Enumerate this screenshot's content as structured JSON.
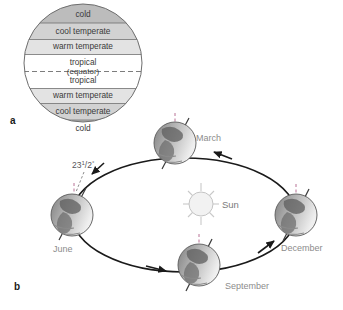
{
  "figure": {
    "background": "#ffffff",
    "panels": [
      {
        "id": "a",
        "letter": "a",
        "caption": ""
      },
      {
        "id": "b",
        "letter": "b",
        "caption": ""
      }
    ]
  },
  "climate_diagram": {
    "panel": "a",
    "equator_label": "(equator)",
    "bands": [
      {
        "label": "cold",
        "hemisphere": "north",
        "fill": "#bcbcbc"
      },
      {
        "label": "cool temperate",
        "hemisphere": "north",
        "fill": "#d2d2d2"
      },
      {
        "label": "warm temperate",
        "hemisphere": "north",
        "fill": "#e3e3e3"
      },
      {
        "label": "tropical",
        "hemisphere": "north",
        "fill": "#ffffff"
      },
      {
        "label": "tropical",
        "hemisphere": "south",
        "fill": "#ffffff"
      },
      {
        "label": "warm temperate",
        "hemisphere": "south",
        "fill": "#e3e3e3"
      },
      {
        "label": "cool temperate",
        "hemisphere": "south",
        "fill": "#d2d2d2"
      },
      {
        "label": "cold",
        "hemisphere": "south",
        "fill": "#bcbcbc"
      }
    ]
  },
  "orbit_diagram": {
    "panel": "b",
    "sun_label": "Sun",
    "axial_tilt_label": "23",
    "axial_tilt_fraction_numerator": "1",
    "axial_tilt_fraction_denominator": "/2",
    "axial_tilt_degree": "°",
    "positions": [
      {
        "label": "March",
        "x": 196,
        "y": 141
      },
      {
        "label": "June",
        "x": 53,
        "y": 252
      },
      {
        "label": "September",
        "x": 225,
        "y": 289
      },
      {
        "label": "December",
        "x": 281,
        "y": 251
      }
    ]
  },
  "colors": {
    "band_cold": "#bcbcbc",
    "band_cool": "#d2d2d2",
    "band_warm": "#e3e3e3",
    "band_tropical": "#ffffff",
    "outline": "#6e6e6e",
    "label_gray": "#8c8c8c",
    "text_dark": "#3a3a3a",
    "orbit_line": "#1a1a1a"
  }
}
